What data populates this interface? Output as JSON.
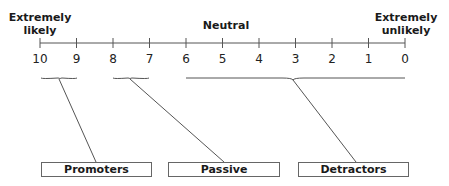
{
  "diagram": {
    "top_labels": {
      "left": [
        "Extremely",
        "likely"
      ],
      "center": "Neutral",
      "right": [
        "Extremely",
        "unlikely"
      ]
    },
    "scale": {
      "ticks": [
        "10",
        "9",
        "8",
        "7",
        "6",
        "5",
        "4",
        "3",
        "2",
        "1",
        "0"
      ]
    },
    "categories": [
      {
        "label": "Promoters",
        "range": [
          "10",
          "9"
        ]
      },
      {
        "label": "Passive",
        "range": [
          "8",
          "7"
        ]
      },
      {
        "label": "Detractors",
        "range": [
          "6",
          "0"
        ]
      }
    ],
    "colors": {
      "line": "#555555",
      "text": "#1a1a1a",
      "box_border": "#666666"
    }
  }
}
